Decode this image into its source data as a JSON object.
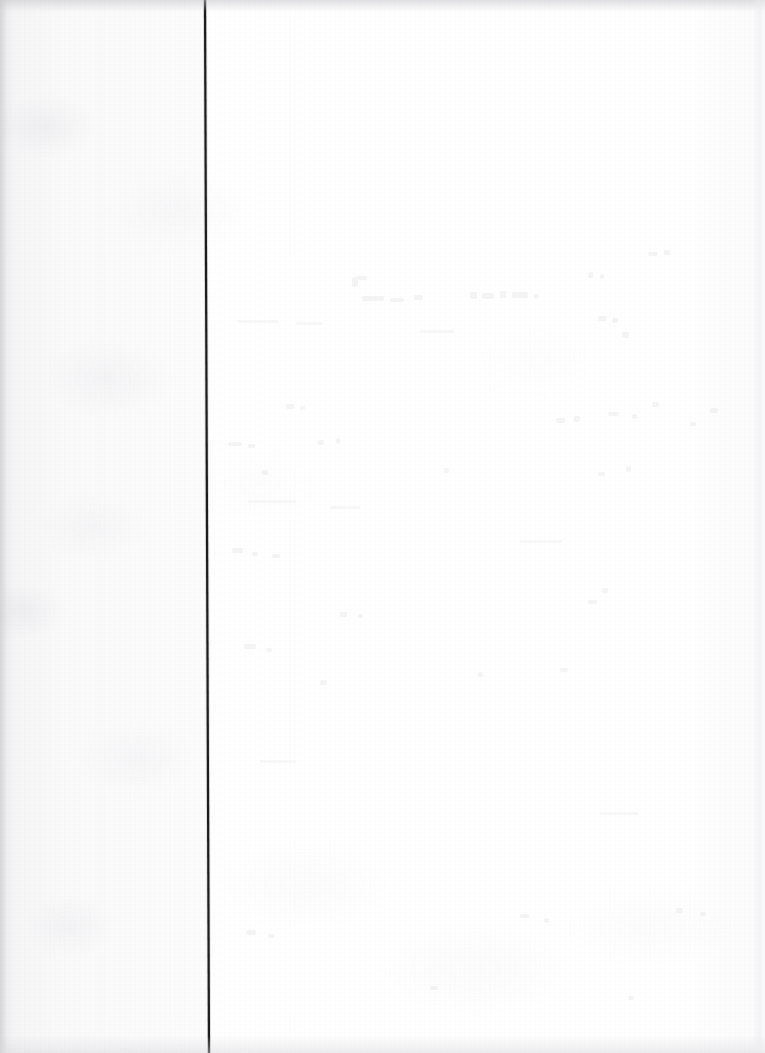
{
  "document": {
    "kind": "scanned-page",
    "title": "Scanned blank page with vertical rule",
    "page_width": 765,
    "page_height": 1053,
    "visible_text": "",
    "text_content_present": false,
    "description": "A blank scanned sheet of paper. A single dark vertical rule runs the full height of the page near the left, dividing a narrow greyish left margin from a wide bright blank field. No printed text is legible; only paper grain and very faint reverse-side bleed-through are visible."
  },
  "colors": {
    "paper": "#fcfcfc",
    "paper_bright": "#ffffff",
    "left_margin_tint": "#f3f3f5",
    "rule_line": "#141414",
    "edge_shadow": "#c6c6ca",
    "bleed_through": "#f2f2f4"
  },
  "rule_line": {
    "name": "vertical-rule",
    "orientation": "vertical",
    "x_top": 205,
    "x_bottom": 209,
    "y_start": 0,
    "y_end": 1053,
    "thickness_px": 2,
    "color": "#141414",
    "spans_full_height": true,
    "tilt_px": 4
  },
  "regions": {
    "left_margin": {
      "name": "left-margin",
      "x": 0,
      "width": 205,
      "label": "",
      "appearance": "light grey mottled paper, slightly darker toward the outer edge"
    },
    "main_field": {
      "name": "main-field",
      "x": 207,
      "width": 558,
      "label": "",
      "appearance": "bright blank white paper with faint bleed-through ghosting in the upper area"
    }
  },
  "artifacts": {
    "top_edge_shadow": true,
    "left_edge_shadow": true,
    "bottom_edge_shadow": true,
    "right_page_edge": true,
    "paper_grain": true,
    "reverse_side_bleed_through": true,
    "legible_characters": 0
  }
}
